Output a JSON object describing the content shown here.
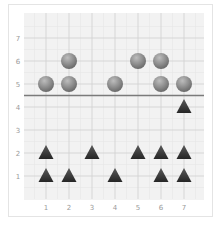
{
  "chart_data": {
    "type": "scatter",
    "title": "",
    "xlabel": "",
    "ylabel": "",
    "xlim": [
      0,
      8
    ],
    "ylim": [
      0,
      8
    ],
    "x_ticks": [
      "1",
      "2",
      "3",
      "4",
      "5",
      "6",
      "7"
    ],
    "y_ticks": [
      "1",
      "2",
      "3",
      "4",
      "5",
      "6",
      "7"
    ],
    "grid": true,
    "legend": null,
    "reference_line": {
      "orientation": "horizontal",
      "y": 4.5,
      "color": "#7a7a7a"
    },
    "series": [
      {
        "name": "circles",
        "marker": "circle",
        "color": "#8a8a8a",
        "points": [
          [
            1,
            5
          ],
          [
            2,
            5
          ],
          [
            2,
            6
          ],
          [
            4,
            5
          ],
          [
            5,
            6
          ],
          [
            6,
            5
          ],
          [
            6,
            6
          ],
          [
            7,
            5
          ]
        ]
      },
      {
        "name": "triangles",
        "marker": "triangle",
        "color": "#3a3a3a",
        "points": [
          [
            1,
            1
          ],
          [
            1,
            2
          ],
          [
            2,
            1
          ],
          [
            3,
            2
          ],
          [
            4,
            1
          ],
          [
            5,
            2
          ],
          [
            6,
            1
          ],
          [
            6,
            2
          ],
          [
            7,
            1
          ],
          [
            7,
            2
          ],
          [
            7,
            4
          ]
        ]
      }
    ]
  },
  "colors": {
    "plot_bg": "#f2f2f2",
    "grid_major": "#cfcfcf",
    "grid_minor": "#e6e6e6",
    "tick_text": "#9a9a9a"
  }
}
